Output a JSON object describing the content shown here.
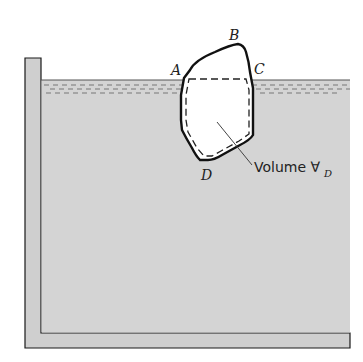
{
  "diagram": {
    "type": "buoyancy-floating-body",
    "points": [
      {
        "id": "A",
        "label": "A"
      },
      {
        "id": "B",
        "label": "B"
      },
      {
        "id": "C",
        "label": "C"
      },
      {
        "id": "D",
        "label": "D"
      }
    ],
    "volume_label": {
      "text": "Volume ",
      "symbol": "∀",
      "subscript": "D"
    },
    "colors": {
      "liquid": "#d4d4d4",
      "wall": "#cfcfcf",
      "outline": "#1a1a1a",
      "body": "#ffffff"
    }
  }
}
